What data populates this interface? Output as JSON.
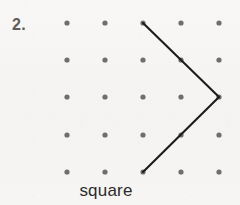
{
  "worksheet": {
    "problem_number": "2.",
    "caption": "square",
    "background_color": "#f6f5f3",
    "dot_color": "#6e6e6e",
    "line_color": "#1c1c1c",
    "text_color": "#2b2b2b",
    "number_color": "#5d5d5d"
  },
  "grid": {
    "columns": 5,
    "rows": 5,
    "x_positions": [
      67,
      105,
      143,
      181,
      219
    ],
    "y_positions": [
      23,
      60,
      97,
      135,
      172
    ],
    "dot_radius": 2.6,
    "dots": [
      {
        "col": 0,
        "row": 0,
        "x": 67,
        "y": 23
      },
      {
        "col": 1,
        "row": 0,
        "x": 105,
        "y": 23
      },
      {
        "col": 2,
        "row": 0,
        "x": 143,
        "y": 23
      },
      {
        "col": 3,
        "row": 0,
        "x": 181,
        "y": 23
      },
      {
        "col": 4,
        "row": 0,
        "x": 219,
        "y": 23
      },
      {
        "col": 0,
        "row": 1,
        "x": 67,
        "y": 60
      },
      {
        "col": 1,
        "row": 1,
        "x": 105,
        "y": 60
      },
      {
        "col": 2,
        "row": 1,
        "x": 143,
        "y": 60
      },
      {
        "col": 3,
        "row": 1,
        "x": 181,
        "y": 60
      },
      {
        "col": 4,
        "row": 1,
        "x": 219,
        "y": 60
      },
      {
        "col": 0,
        "row": 2,
        "x": 67,
        "y": 97
      },
      {
        "col": 1,
        "row": 2,
        "x": 105,
        "y": 97
      },
      {
        "col": 2,
        "row": 2,
        "x": 143,
        "y": 97
      },
      {
        "col": 3,
        "row": 2,
        "x": 181,
        "y": 97
      },
      {
        "col": 4,
        "row": 2,
        "x": 219,
        "y": 97
      },
      {
        "col": 0,
        "row": 3,
        "x": 67,
        "y": 135
      },
      {
        "col": 1,
        "row": 3,
        "x": 105,
        "y": 135
      },
      {
        "col": 2,
        "row": 3,
        "x": 143,
        "y": 135
      },
      {
        "col": 3,
        "row": 3,
        "x": 181,
        "y": 135
      },
      {
        "col": 4,
        "row": 3,
        "x": 219,
        "y": 135
      },
      {
        "col": 0,
        "row": 4,
        "x": 67,
        "y": 172
      },
      {
        "col": 1,
        "row": 4,
        "x": 105,
        "y": 172
      },
      {
        "col": 2,
        "row": 4,
        "x": 143,
        "y": 172
      },
      {
        "col": 3,
        "row": 4,
        "x": 181,
        "y": 172
      },
      {
        "col": 4,
        "row": 4,
        "x": 219,
        "y": 172
      }
    ]
  },
  "drawing": {
    "description": "open chevron pointing right",
    "stroke_width": 2.1,
    "points": [
      {
        "x": 143,
        "y": 23
      },
      {
        "x": 219,
        "y": 97
      },
      {
        "x": 143,
        "y": 172
      }
    ],
    "polyline": "143,23 219,97 143,172"
  }
}
